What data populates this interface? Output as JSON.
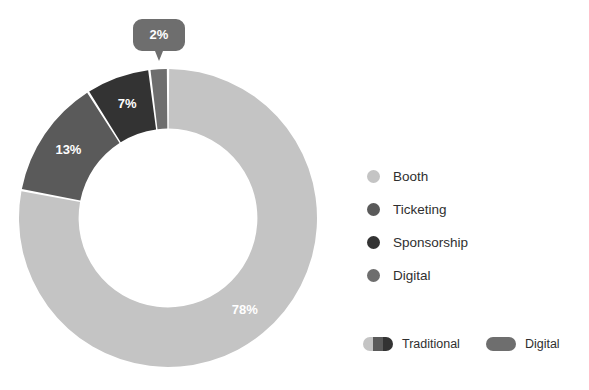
{
  "page": {
    "title_remnant": "· · · · · ·",
    "background": "#ffffff"
  },
  "chart_data": {
    "type": "pie",
    "variant": "donut",
    "title": "",
    "xlabel": "",
    "ylabel": "",
    "categories": [
      "Booth",
      "Ticketing",
      "Sponsorship",
      "Digital"
    ],
    "values": [
      78,
      13,
      7,
      2
    ],
    "value_labels": [
      "78%",
      "13%",
      "7%",
      "2%"
    ],
    "colors": [
      "#c4c4c4",
      "#5a5a5a",
      "#333333",
      "#6e6e6e"
    ],
    "units": "percent",
    "total": 100,
    "start_angle_deg": 0,
    "direction": "clockwise",
    "inner_radius_ratio": 0.6,
    "legend_position": "right",
    "grid": false,
    "slices": [
      {
        "name": "Booth",
        "value": 78,
        "label": "78%",
        "color": "#c4c4c4",
        "label_color": "#ffffff",
        "group": "Traditional",
        "callout": false
      },
      {
        "name": "Ticketing",
        "value": 13,
        "label": "13%",
        "color": "#5a5a5a",
        "label_color": "#ffffff",
        "group": "Traditional",
        "callout": false
      },
      {
        "name": "Sponsorship",
        "value": 7,
        "label": "7%",
        "color": "#333333",
        "label_color": "#ffffff",
        "group": "Traditional",
        "callout": false
      },
      {
        "name": "Digital",
        "value": 2,
        "label": "2%",
        "color": "#6e6e6e",
        "label_color": "#ffffff",
        "group": "Digital",
        "callout": true
      }
    ]
  },
  "legend": {
    "items": [
      {
        "label": "Booth",
        "color": "#c4c4c4"
      },
      {
        "label": "Ticketing",
        "color": "#5a5a5a"
      },
      {
        "label": "Sponsorship",
        "color": "#333333"
      },
      {
        "label": "Digital",
        "color": "#6e6e6e"
      }
    ]
  },
  "group_legend": {
    "items": [
      {
        "label": "Traditional",
        "colors": [
          "#c4c4c4",
          "#5a5a5a",
          "#333333"
        ]
      },
      {
        "label": "Digital",
        "colors": [
          "#6e6e6e"
        ]
      }
    ]
  },
  "callout": {
    "label": "2%",
    "color": "#6e6e6e",
    "text_color": "#ffffff"
  }
}
